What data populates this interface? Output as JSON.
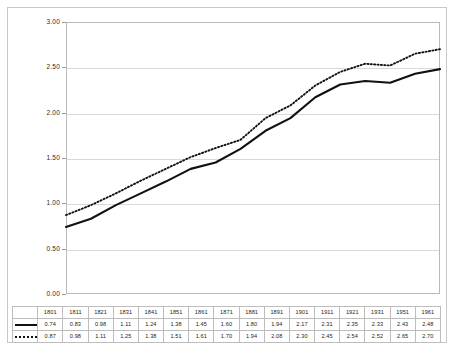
{
  "chart_data": {
    "type": "line",
    "title": "",
    "subtitle": "",
    "xlabel": "",
    "ylabel": "",
    "categories": [
      "1801",
      "1811",
      "1821",
      "1831",
      "1841",
      "1851",
      "1861",
      "1871",
      "1881",
      "1891",
      "1901",
      "1911",
      "1921",
      "1931",
      "1951",
      "1961"
    ],
    "series": [
      {
        "name": "Male",
        "style": "solid",
        "color": "#111111",
        "values": [
          0.74,
          0.83,
          0.98,
          1.11,
          1.24,
          1.38,
          1.45,
          1.6,
          1.8,
          1.94,
          2.17,
          2.31,
          2.35,
          2.33,
          2.43,
          2.48
        ]
      },
      {
        "name": "Female",
        "style": "dotted",
        "color": "#111111",
        "values": [
          0.87,
          0.98,
          1.11,
          1.25,
          1.38,
          1.51,
          1.61,
          1.7,
          1.94,
          2.08,
          2.3,
          2.45,
          2.54,
          2.52,
          2.65,
          2.7
        ]
      }
    ],
    "ylim": [
      0.0,
      3.0
    ],
    "yticks": [
      "0.00",
      "0.50",
      "1.00",
      "1.50",
      "2.00",
      "2.50",
      "3.00"
    ],
    "ytick_values": [
      0.0,
      0.5,
      1.0,
      1.5,
      2.0,
      2.5,
      3.0
    ],
    "grid": true,
    "legend_position": "table-left"
  }
}
